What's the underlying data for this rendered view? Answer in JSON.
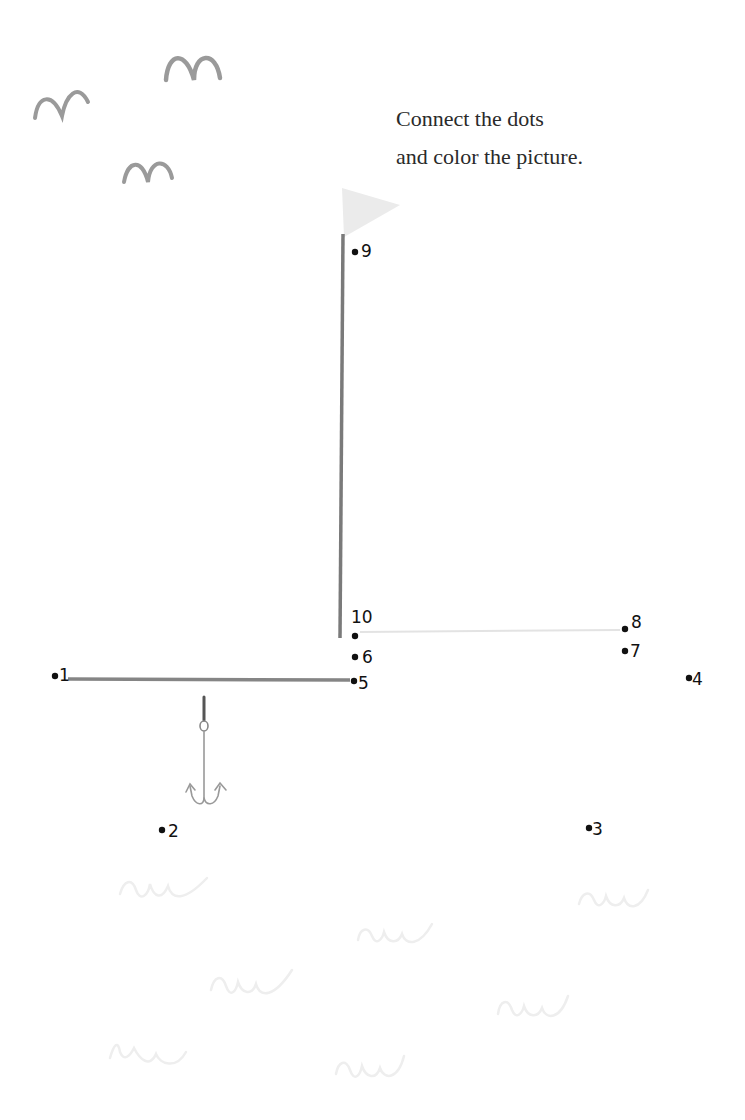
{
  "instructions": {
    "line1": "Connect the dots",
    "line2": "and color the picture."
  },
  "colors": {
    "text": "#2a2a2a",
    "dots": "#111111",
    "mast": "#7a7a7a",
    "flag": "#e8e8e8",
    "birds": "#9a9a9a",
    "waves": "#eeeeee",
    "guide_line": "#e6e6e6"
  },
  "icons": {
    "birds": [
      "bird-icon",
      "bird-icon",
      "bird-icon"
    ],
    "flag": "flag-icon",
    "hook": "anchor-hook-icon",
    "waves": [
      "wave-icon",
      "wave-icon",
      "wave-icon",
      "wave-icon",
      "wave-icon",
      "wave-icon",
      "wave-icon"
    ]
  },
  "dots": [
    {
      "n": "1",
      "x": 55,
      "y": 676
    },
    {
      "n": "2",
      "x": 162,
      "y": 830
    },
    {
      "n": "3",
      "x": 589,
      "y": 828
    },
    {
      "n": "4",
      "x": 689,
      "y": 678
    },
    {
      "n": "5",
      "x": 354,
      "y": 681
    },
    {
      "n": "6",
      "x": 355,
      "y": 657
    },
    {
      "n": "7",
      "x": 625,
      "y": 651
    },
    {
      "n": "8",
      "x": 625,
      "y": 629
    },
    {
      "n": "9",
      "x": 355,
      "y": 252
    },
    {
      "n": "10",
      "x": 355,
      "y": 635
    }
  ]
}
